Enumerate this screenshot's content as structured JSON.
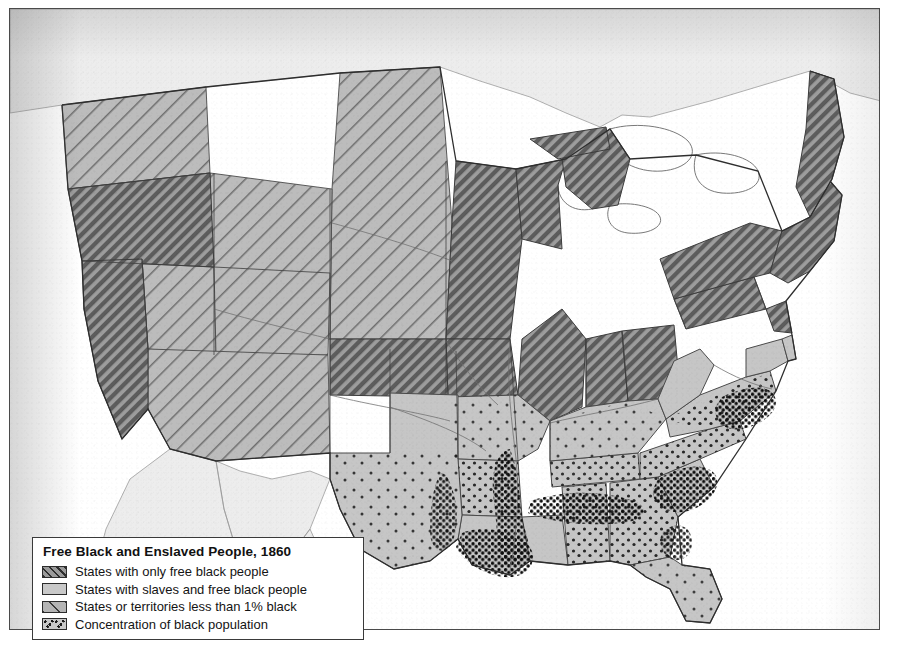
{
  "map": {
    "title": "Free Black and Enslaved People, 1860",
    "subject": "United States distribution of free black and enslaved population, 1860",
    "projection_note": "Continental United States with Canada and Mexico shown unshaded",
    "background_color": "#ffffff",
    "frame_color": "#4a4a4a"
  },
  "legend": {
    "title": "Free Black and Enslaved People, 1860",
    "items": [
      {
        "swatch": "dark-diagonal-hatch",
        "label": "States with only free black people",
        "color": "#9a9a9a"
      },
      {
        "swatch": "light-solid-gray",
        "label": "States with slaves and free black people",
        "color": "#c9c9c9"
      },
      {
        "swatch": "medium-sparse-hatch",
        "label": "States or territories less than 1% black",
        "color": "#b4b4b4"
      },
      {
        "swatch": "black-stipple-dots",
        "label": "Concentration of black population",
        "color": "#1a1a1a"
      }
    ]
  },
  "categories": {
    "free_states": {
      "pattern": "dark diagonal hatch",
      "members": [
        "Maine",
        "New Hampshire",
        "Vermont",
        "Massachusetts",
        "Rhode Island",
        "Connecticut",
        "New York",
        "Pennsylvania",
        "New Jersey",
        "Ohio",
        "Indiana",
        "Illinois",
        "Michigan",
        "Wisconsin",
        "Minnesota",
        "Iowa",
        "California",
        "Oregon",
        "Kansas"
      ]
    },
    "slave_states": {
      "pattern": "light solid gray",
      "members": [
        "Delaware",
        "Maryland",
        "Virginia",
        "North Carolina",
        "South Carolina",
        "Georgia",
        "Florida",
        "Alabama",
        "Mississippi",
        "Louisiana",
        "Texas",
        "Arkansas",
        "Tennessee",
        "Kentucky",
        "Missouri"
      ]
    },
    "territories_under_one_percent": {
      "pattern": "medium sparse hatch",
      "members": [
        "Washington Territory",
        "Dakota Territory",
        "Nebraska Territory",
        "Utah Territory",
        "Nevada Territory",
        "Colorado Territory",
        "New Mexico Territory",
        "Indian Territory"
      ]
    },
    "concentration": {
      "pattern": "black stipple dots",
      "note": "Densest stippling along the Mississippi River valley, Alabama–Georgia Black Belt, South Carolina low country and Virginia tidewater"
    }
  }
}
